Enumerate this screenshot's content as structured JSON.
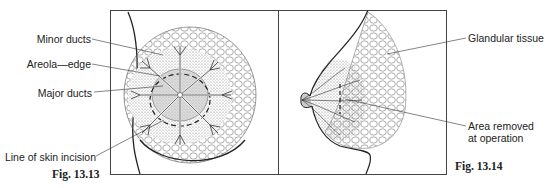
{
  "figures": [
    {
      "id": "fig-13-13",
      "caption": "Fig. 13.13",
      "labels": {
        "minor_ducts": "Minor ducts",
        "areola_edge": "Areola—edge",
        "major_ducts": "Major ducts",
        "incision": "Line of skin incision"
      }
    },
    {
      "id": "fig-13-14",
      "caption": "Fig. 13.14",
      "labels": {
        "glandular": "Glandular tissue",
        "area_removed_line1": "Area removed",
        "area_removed_line2": "at operation"
      }
    }
  ]
}
